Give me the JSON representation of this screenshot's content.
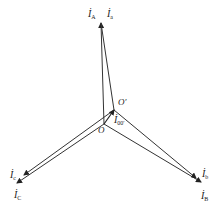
{
  "diagram": {
    "type": "phasor-diagram",
    "points": {
      "O": "O",
      "O_prime": "O′"
    },
    "phasors": [
      {
        "id": "IA",
        "symbol": "İ",
        "sub": "A"
      },
      {
        "id": "Ia",
        "symbol": "İ",
        "sub": "a"
      },
      {
        "id": "IB",
        "symbol": "İ",
        "sub": "B"
      },
      {
        "id": "Ib",
        "symbol": "İ",
        "sub": "b"
      },
      {
        "id": "IC",
        "symbol": "İ",
        "sub": "C"
      },
      {
        "id": "Ic",
        "symbol": "İ",
        "sub": "c"
      },
      {
        "id": "I00",
        "symbol": "İ",
        "sub": "00′"
      }
    ],
    "colors": {
      "stroke": "#333333",
      "text": "#222222"
    }
  }
}
